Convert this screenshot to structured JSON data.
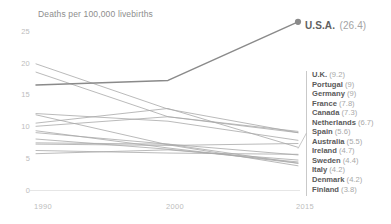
{
  "chart_data": {
    "type": "line",
    "title": "Deaths per 100,000 livebirths",
    "xlabel": "",
    "ylabel": "",
    "x": [
      1990,
      2000,
      2015
    ],
    "xtick_labels": [
      "1990",
      "2000",
      "2015"
    ],
    "ytick_labels": [
      "0",
      "5",
      "10",
      "15",
      "20",
      "25"
    ],
    "yticks": [
      0,
      5,
      10,
      15,
      20,
      25
    ],
    "ylim": [
      0,
      27
    ],
    "grid": false,
    "legend_position": "right",
    "highlight_series": "U.S.A.",
    "highlight_label": "U.S.A.",
    "highlight_value": "(26.4)",
    "series": [
      {
        "name": "U.S.A.",
        "values": [
          16.5,
          17.2,
          26.4
        ],
        "highlight": true
      },
      {
        "name": "U.K.",
        "values": [
          10.0,
          11.5,
          9.2
        ],
        "highlight": false
      },
      {
        "name": "Portugal",
        "values": [
          19.8,
          12.7,
          9.0
        ],
        "highlight": false
      },
      {
        "name": "Germany",
        "values": [
          18.5,
          11.5,
          9.0
        ],
        "highlight": false
      },
      {
        "name": "France",
        "values": [
          12.0,
          10.8,
          7.8
        ],
        "highlight": false
      },
      {
        "name": "Canada",
        "values": [
          7.2,
          7.0,
          7.3
        ],
        "highlight": false
      },
      {
        "name": "Netherlands",
        "values": [
          10.5,
          12.8,
          6.7
        ],
        "highlight": false
      },
      {
        "name": "Spain",
        "values": [
          6.2,
          5.8,
          5.6
        ],
        "highlight": false
      },
      {
        "name": "Australia",
        "values": [
          7.4,
          7.2,
          5.5
        ],
        "highlight": false
      },
      {
        "name": "Ireland",
        "values": [
          5.7,
          6.3,
          4.7
        ],
        "highlight": false
      },
      {
        "name": "Sweden",
        "values": [
          8.0,
          6.4,
          4.4
        ],
        "highlight": false
      },
      {
        "name": "Italy",
        "values": [
          9.3,
          6.6,
          4.2
        ],
        "highlight": false
      },
      {
        "name": "Denmark",
        "values": [
          9.0,
          7.2,
          4.2
        ],
        "highlight": false
      },
      {
        "name": "Finland",
        "values": [
          11.8,
          7.1,
          3.8
        ],
        "highlight": false
      }
    ],
    "legend_entries": [
      {
        "name": "U.K.",
        "value": "(9.2)"
      },
      {
        "name": "Portugal",
        "value": "(9)"
      },
      {
        "name": "Germany",
        "value": "(9)"
      },
      {
        "name": "France",
        "value": "(7.8)"
      },
      {
        "name": "Canada",
        "value": "(7.3)"
      },
      {
        "name": "Netherlands",
        "value": "(6.7)"
      },
      {
        "name": "Spain",
        "value": "(5.6)"
      },
      {
        "name": "Australia",
        "value": "(5.5)"
      },
      {
        "name": "Ireland",
        "value": "(4.7)"
      },
      {
        "name": "Sweden",
        "value": "(4.4)"
      },
      {
        "name": "Italy",
        "value": "(4.2)"
      },
      {
        "name": "Denmark",
        "value": "(4.2)"
      },
      {
        "name": "Finland",
        "value": "(3.8)"
      }
    ],
    "colors": {
      "highlight_line": "#8a8a8a",
      "series_line": "#a9a9a9",
      "axis": "#e6e6e6",
      "tick_text": "#bdbdbd",
      "title_text": "#8d8d8d",
      "legend_name": "#5a5a5a",
      "legend_value": "#a8a8a8",
      "background": "#ffffff"
    }
  }
}
